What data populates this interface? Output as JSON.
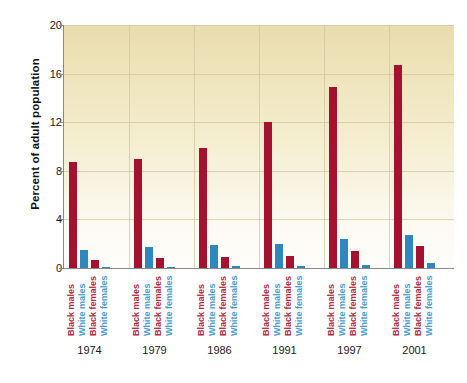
{
  "chart_data": {
    "type": "bar",
    "title": "",
    "xlabel": "",
    "ylabel": "Percent of adult population",
    "ylim": [
      0,
      20
    ],
    "yticks": [
      0,
      4,
      8,
      12,
      16,
      20
    ],
    "grid": true,
    "legend_position": "none",
    "categories": [
      "1974",
      "1979",
      "1986",
      "1991",
      "1997",
      "2001"
    ],
    "group_labels": [
      "Black males",
      "White males",
      "Black females",
      "White females"
    ],
    "series": [
      {
        "name": "Black males",
        "color": "#a4122f",
        "values": [
          8.7,
          9.0,
          9.9,
          12.0,
          14.9,
          16.7
        ]
      },
      {
        "name": "White males",
        "color": "#2e87bd",
        "values": [
          1.5,
          1.7,
          1.9,
          2.0,
          2.4,
          2.7
        ]
      },
      {
        "name": "Black females",
        "color": "#a4122f",
        "values": [
          0.7,
          0.8,
          0.9,
          1.0,
          1.4,
          1.8
        ]
      },
      {
        "name": "White females",
        "color": "#2e87bd",
        "values": [
          0.1,
          0.1,
          0.15,
          0.2,
          0.25,
          0.4
        ]
      }
    ]
  },
  "colors": {
    "black_series": "#a4122f",
    "white_series": "#2e87bd",
    "black_label": "#b32a42",
    "white_label": "#4a9bd1",
    "plot_top": "#e9dcae",
    "plot_bottom": "#fefdfa",
    "gridline": "#cfc79f",
    "axis": "#8a8a8a",
    "page_background": "#ffffff"
  }
}
